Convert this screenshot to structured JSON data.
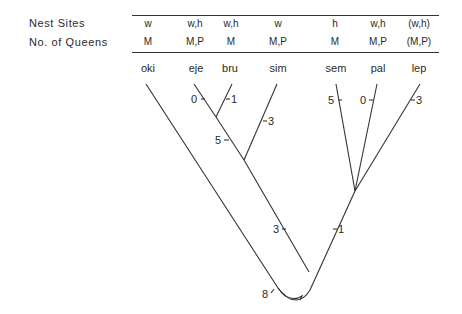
{
  "table": {
    "rows": [
      {
        "label": "Nest Sites",
        "values": [
          "w",
          "w,h",
          "w,h",
          "w",
          "h",
          "w,h",
          "(w,h)"
        ]
      },
      {
        "label": "No. of Queens",
        "values": [
          "M",
          "M,P",
          "M",
          "M,P",
          "M",
          "M,P",
          "(M,P)"
        ]
      }
    ]
  },
  "taxa": [
    "oki",
    "eje",
    "bru",
    "sim",
    "sem",
    "pal",
    "lep"
  ],
  "branch_labels": {
    "eje": "0",
    "bru": "1",
    "sim": "3",
    "eje_bru_stem": "5",
    "sem": "5",
    "pal": "0",
    "lep": "3",
    "left_clade_stem": "3",
    "right_clade_stem": "1",
    "root": "8"
  }
}
